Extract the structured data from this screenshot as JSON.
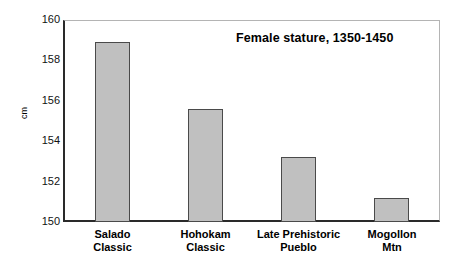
{
  "chart_data": {
    "type": "bar",
    "title": "Female stature, 1350-1450",
    "xlabel": "",
    "ylabel": "cm",
    "ylim": [
      150,
      160
    ],
    "yticks": [
      150,
      152,
      154,
      156,
      158,
      160
    ],
    "ytick_labels": [
      "150",
      "152",
      "154",
      "156",
      "158",
      "160"
    ],
    "grid": false,
    "legend": "none",
    "categories": [
      "Salado Classic",
      "Hohokam Classic",
      "Late Prehistoric Pueblo",
      "Mogollon Mtn"
    ],
    "category_lines": [
      [
        "Salado",
        "Classic"
      ],
      [
        "Hohokam",
        "Classic"
      ],
      [
        "Late Prehistoric",
        "Pueblo"
      ],
      [
        "Mogollon",
        "Mtn"
      ]
    ],
    "values": [
      158.9,
      155.6,
      153.2,
      151.2
    ],
    "units": "cm",
    "bar_fill_color": "#c0c0c0",
    "bar_edge_color": "#4a4a4a",
    "axis_color": "#2a2a2a",
    "background_color": "#ffffff"
  },
  "axis": {
    "y_title": "cm",
    "tick_0": "150",
    "tick_1": "152",
    "tick_2": "154",
    "tick_3": "156",
    "tick_4": "158",
    "tick_5": "160"
  },
  "annotations": {
    "title": "Female stature, 1350-1450"
  },
  "labels": {
    "cat0_line1": "Salado",
    "cat0_line2": "Classic",
    "cat1_line1": "Hohokam",
    "cat1_line2": "Classic",
    "cat2_line1": "Late Prehistoric",
    "cat2_line2": "Pueblo",
    "cat3_line1": "Mogollon",
    "cat3_line2": "Mtn"
  }
}
